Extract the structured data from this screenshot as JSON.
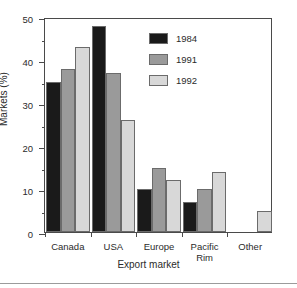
{
  "chart_data": {
    "type": "bar",
    "title": "",
    "xlabel": "Export market",
    "ylabel": "Markets (%)",
    "categories": [
      "Canada",
      "USA",
      "Europe",
      "Pacific\nRim",
      "Other"
    ],
    "series": [
      {
        "name": "1984",
        "color": "#1a1a1a",
        "values": [
          35,
          48,
          10,
          7,
          0
        ]
      },
      {
        "name": "1991",
        "color": "#9a9a9a",
        "values": [
          38,
          37,
          15,
          10,
          0
        ]
      },
      {
        "name": "1992",
        "color": "#d8d8d8",
        "values": [
          43,
          26,
          12,
          14,
          5
        ]
      }
    ],
    "ylim": [
      0,
      50
    ],
    "ytick_labels": [
      "0",
      "10",
      "20",
      "30",
      "40",
      "50"
    ],
    "ytick_values": [
      0,
      10,
      20,
      30,
      40,
      50
    ],
    "yminor_values": [
      5,
      15,
      25,
      35,
      45
    ],
    "grid": false,
    "legend_position": "upper-right-inside"
  },
  "figure": {
    "frame_color": "#4a4a4a",
    "background": "#ffffff",
    "bar_edge_color": "#6b6b6b"
  }
}
